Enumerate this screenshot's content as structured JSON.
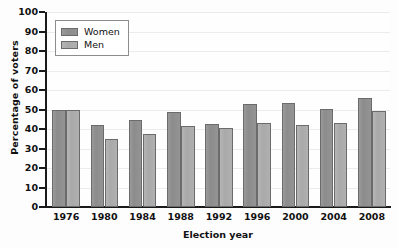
{
  "chart_data": {
    "type": "bar",
    "title": "",
    "xlabel": "Election year",
    "ylabel": "Percentage of voters",
    "categories": [
      "1976",
      "1980",
      "1984",
      "1988",
      "1992",
      "1996",
      "2000",
      "2004",
      "2008"
    ],
    "series": [
      {
        "name": "Women",
        "color": "#8c8c8c",
        "values": [
          49.5,
          42,
          44.8,
          48.5,
          42.5,
          53,
          53.3,
          50.5,
          56
        ]
      },
      {
        "name": "Men",
        "color": "#a9a9a9",
        "values": [
          49.8,
          34.7,
          37.2,
          41.4,
          40.5,
          43,
          42,
          43.3,
          49.2
        ]
      }
    ],
    "ylim": [
      0,
      100
    ],
    "ytick_step": 10,
    "yticks": [
      "100",
      "90",
      "80",
      "70",
      "60",
      "50",
      "40",
      "30",
      "20",
      "10",
      "0"
    ],
    "ytick_values": [
      100,
      90,
      80,
      70,
      60,
      50,
      40,
      30,
      20,
      10,
      0
    ],
    "grid": true,
    "grid_axis": "y",
    "legend_position": "upper-left-inside"
  },
  "legend": {
    "entries": [
      {
        "label": "Women"
      },
      {
        "label": "Men"
      }
    ]
  }
}
